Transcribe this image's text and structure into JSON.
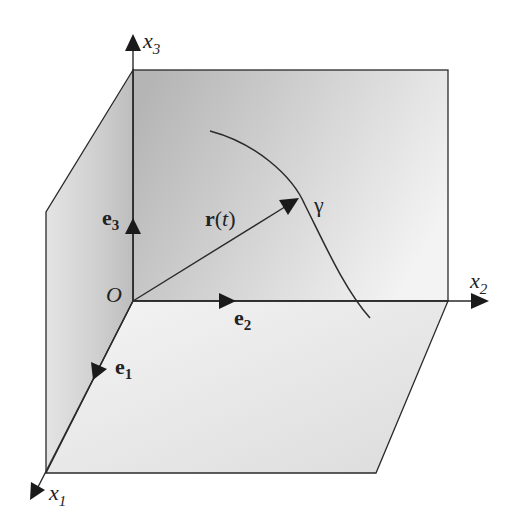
{
  "figure": {
    "origin_label": "O",
    "axes": [
      {
        "name": "x1",
        "base": "x",
        "sub": "1"
      },
      {
        "name": "x2",
        "base": "x",
        "sub": "2"
      },
      {
        "name": "x3",
        "base": "x",
        "sub": "3"
      }
    ],
    "basis_vectors": [
      {
        "name": "e1",
        "base": "e",
        "sub": "1"
      },
      {
        "name": "e2",
        "base": "e",
        "sub": "2"
      },
      {
        "name": "e3",
        "base": "e",
        "sub": "3"
      }
    ],
    "position_vector": {
      "bold": "r",
      "open": "(",
      "param": "t",
      "close": ")"
    },
    "curve_label": "γ",
    "colors": {
      "line": "#2a2a2a",
      "back_plane_dark": "#b8b8b8",
      "back_plane_light": "#f2f2f2",
      "side_plane_dark": "#c4c4c4",
      "side_plane_light": "#ececec",
      "floor_plane": "#e6e6e6"
    }
  }
}
